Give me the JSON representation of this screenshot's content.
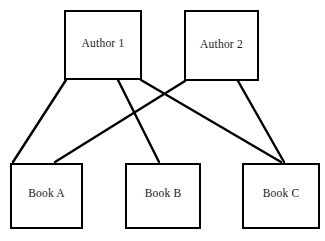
{
  "diagram": {
    "type": "bipartite-graph",
    "stroke_color": "#000000",
    "fill_color": "#ffffff",
    "text_color": "#1a1a1a",
    "nodes": [
      {
        "id": "author-1",
        "label": "Author 1",
        "group": "authors",
        "x": 64,
        "y": 10,
        "w": 78,
        "h": 70
      },
      {
        "id": "author-2",
        "label": "Author 2",
        "group": "authors",
        "x": 184,
        "y": 10,
        "w": 75,
        "h": 71
      },
      {
        "id": "book-a",
        "label": "Book A",
        "group": "books",
        "x": 10,
        "y": 163,
        "w": 73,
        "h": 66
      },
      {
        "id": "book-b",
        "label": "Book B",
        "group": "books",
        "x": 125,
        "y": 163,
        "w": 76,
        "h": 66
      },
      {
        "id": "book-c",
        "label": "Book C",
        "group": "books",
        "x": 242,
        "y": 163,
        "w": 78,
        "h": 66
      }
    ],
    "edges": [
      {
        "id": "edge-author1-booka",
        "from": "author-1",
        "to": "book-a",
        "x1": 66,
        "y1": 80,
        "x2": 13,
        "y2": 162
      },
      {
        "id": "edge-author1-bookb",
        "from": "author-1",
        "to": "book-b",
        "x1": 118,
        "y1": 80,
        "x2": 159,
        "y2": 162
      },
      {
        "id": "edge-author1-bookc",
        "from": "author-1",
        "to": "book-c",
        "x1": 141,
        "y1": 80,
        "x2": 281,
        "y2": 162
      },
      {
        "id": "edge-author2-booka",
        "from": "author-2",
        "to": "book-a",
        "x1": 185,
        "y1": 81,
        "x2": 55,
        "y2": 162
      },
      {
        "id": "edge-author2-bookc",
        "from": "author-2",
        "to": "book-c",
        "x1": 238,
        "y1": 81,
        "x2": 284,
        "y2": 162
      }
    ]
  }
}
